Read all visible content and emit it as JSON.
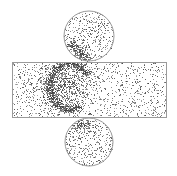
{
  "diagram": {
    "type": "cylinder-net-scatter",
    "canvas": {
      "width": 177,
      "height": 176,
      "background": "#ffffff"
    },
    "outline_color": "#9a9a9a",
    "point_color": "#3a3a3a",
    "top_cap": {
      "cx": 89,
      "cy": 36,
      "r": 25
    },
    "lateral_surface": {
      "x": 12,
      "y": 62,
      "width": 154,
      "height": 55
    },
    "bottom_cap": {
      "cx": 89,
      "cy": 142,
      "r": 24
    },
    "scatter": {
      "seed": 7,
      "uniform_counts": {
        "top_cap": 380,
        "lateral_surface": 1100,
        "bottom_cap": 380
      },
      "density_hotspots": [
        {
          "region": "lateral_surface",
          "shape": "ring",
          "cx": 70,
          "cy": 86,
          "rx": 21,
          "ry": 23,
          "thickness": 5,
          "count": 900,
          "arc_from_deg": 60,
          "arc_to_deg": 330
        },
        {
          "region": "lateral_surface",
          "shape": "blob",
          "cx": 62,
          "cy": 84,
          "rx": 34,
          "ry": 26,
          "count": 700
        },
        {
          "region": "top_cap",
          "shape": "streak",
          "x1": 70,
          "y1": 42,
          "x2": 88,
          "y2": 60,
          "width": 6,
          "count": 220
        },
        {
          "region": "bottom_cap",
          "shape": "blob",
          "cx": 80,
          "cy": 124,
          "rx": 12,
          "ry": 6,
          "count": 90
        }
      ]
    }
  }
}
